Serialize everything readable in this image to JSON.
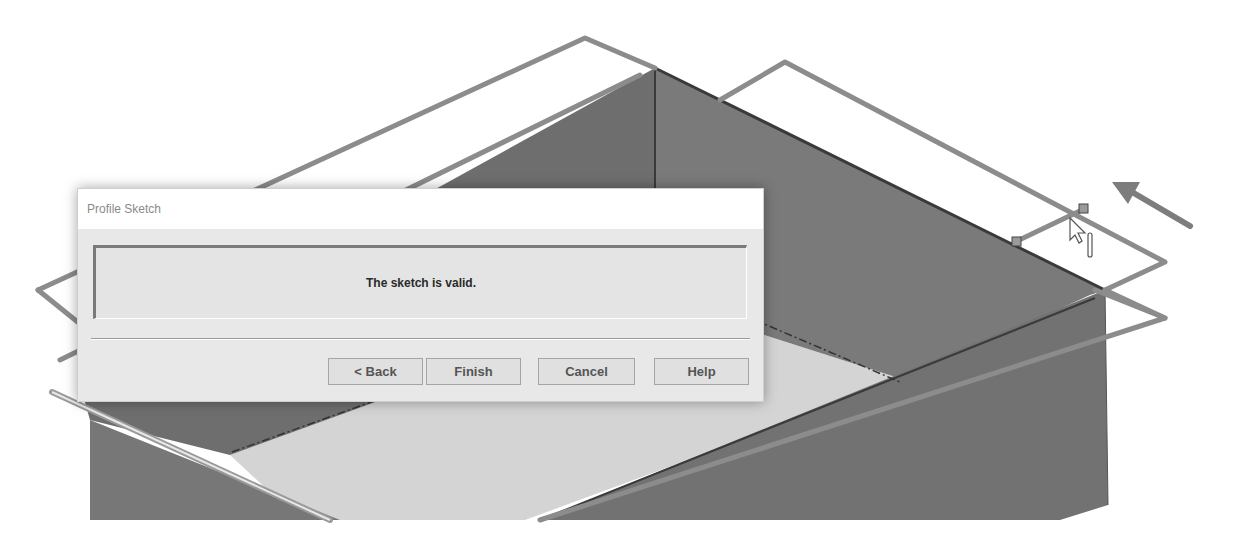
{
  "viewport": {
    "description": "3D CAD view of an open sheet-metal tray with a profile sketch outline",
    "colors": {
      "background": "#ffffff",
      "sketch_line": "#8c8c8c",
      "wall_dark": "#6b6b6b",
      "wall_mid": "#7d7d7d",
      "floor": "#d2d2d2",
      "edge_dark": "#3a3a3a"
    },
    "icons": {
      "cursor": "mouse-pointer-icon",
      "direction_arrow": "direction-arrow-icon",
      "sketch_handle": "sketch-point-handle"
    }
  },
  "dialog": {
    "title": "Profile Sketch",
    "message": "The sketch is valid.",
    "buttons": {
      "back": "< Back",
      "finish": "Finish",
      "cancel": "Cancel",
      "help": "Help"
    }
  }
}
